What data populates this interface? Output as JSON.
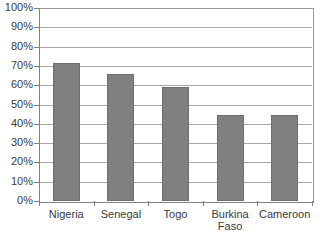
{
  "chart_data": {
    "type": "bar",
    "title": "",
    "subtitle": "",
    "xlabel": "",
    "ylabel": "",
    "categories": [
      "Nigeria",
      "Senegal",
      "Togo",
      "Burkina Faso",
      "Cameroon"
    ],
    "values": [
      71.5,
      66,
      59,
      44.5,
      44.5
    ],
    "ylim": [
      0,
      100
    ],
    "ytick_labels": [
      "100%",
      "90%",
      "80%",
      "70%",
      "60%",
      "50%",
      "40%",
      "30%",
      "20%",
      "10%",
      "0%"
    ],
    "ytick_values": [
      100,
      90,
      80,
      70,
      60,
      50,
      40,
      30,
      20,
      10,
      0
    ],
    "grid": true,
    "legend": false,
    "legend_position": "none",
    "series": [
      {
        "name": "",
        "values": [
          71.5,
          66,
          59,
          44.5,
          44.5
        ]
      }
    ],
    "colors": {
      "bar_fill": "#808080",
      "bar_border": "#6e6e6e",
      "gridline": "#a8a8a8",
      "axis": "#808080",
      "text": "#3a3a3a",
      "background": "#ffffff"
    }
  }
}
